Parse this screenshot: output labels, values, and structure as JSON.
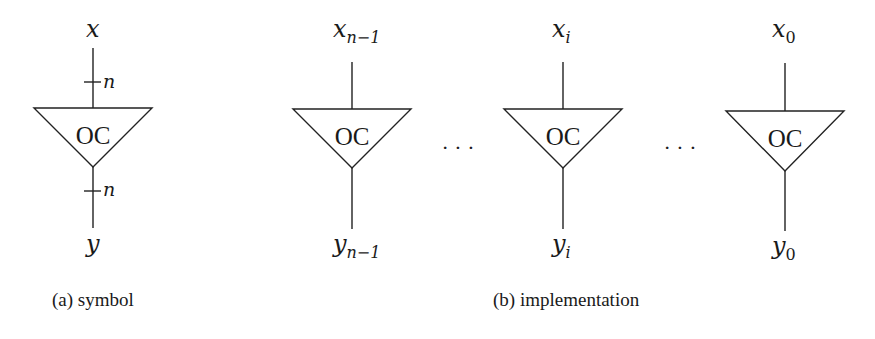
{
  "symbol": {
    "input_label": "x",
    "output_label": "y",
    "bus_width_top": "n",
    "bus_width_bottom": "n",
    "gate_label": "OC",
    "caption": "(a) symbol"
  },
  "implementation": {
    "gates": [
      {
        "input_base": "x",
        "input_sub": "n−1",
        "output_base": "y",
        "output_sub": "n−1",
        "gate_label": "OC"
      },
      {
        "input_base": "x",
        "input_sub": "i",
        "output_base": "y",
        "output_sub": "i",
        "gate_label": "OC"
      },
      {
        "input_base": "x",
        "input_sub": "0",
        "output_base": "y",
        "output_sub": "0",
        "gate_label": "OC"
      }
    ],
    "ellipsis": "· · ·",
    "caption": "(b) implementation"
  }
}
